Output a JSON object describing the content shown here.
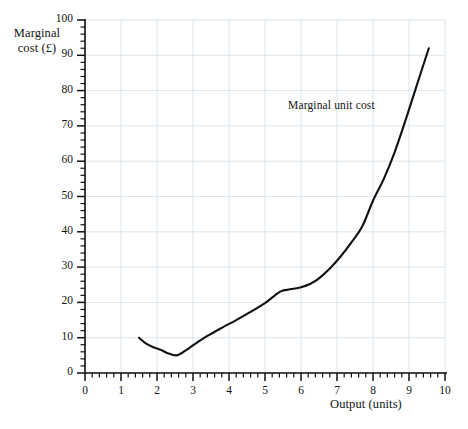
{
  "chart_data": {
    "type": "line",
    "title": "",
    "xlabel": "Output (units)",
    "ylabel": "Marginal cost (£)",
    "xlim": [
      0,
      10
    ],
    "ylim": [
      0,
      100
    ],
    "grid": true,
    "legend_position": "inline-annotation",
    "annotations": [
      {
        "text": "Marginal unit cost",
        "x": 7.0,
        "y": 73
      }
    ],
    "xticks": [
      0,
      1,
      2,
      3,
      4,
      5,
      6,
      7,
      8,
      9,
      10
    ],
    "xtick_labels": [
      "0",
      "1",
      "2",
      "3",
      "4",
      "5",
      "6",
      "7",
      "8",
      "9",
      "10"
    ],
    "xminor_tick_step": 0.2,
    "yticks": [
      0,
      10,
      20,
      30,
      40,
      50,
      60,
      70,
      80,
      90,
      100
    ],
    "ytick_labels": [
      "0",
      "10",
      "20",
      "30",
      "40",
      "50",
      "60",
      "70",
      "80",
      "90",
      "100"
    ],
    "yminor_tick_step": 2,
    "series": [
      {
        "name": "Marginal unit cost",
        "color": "#111111",
        "x": [
          1.5,
          1.7,
          1.9,
          2.1,
          2.3,
          2.55,
          2.8,
          3.05,
          3.4,
          3.8,
          4.2,
          4.6,
          5.0,
          5.25,
          5.45,
          5.7,
          6.0,
          6.25,
          6.5,
          6.8,
          7.1,
          7.4,
          7.7,
          8.0,
          8.3,
          8.6,
          8.9,
          9.2,
          9.55
        ],
        "y": [
          10.0,
          8.3,
          7.3,
          6.6,
          5.6,
          5.0,
          6.4,
          8.2,
          10.5,
          12.8,
          15.0,
          17.3,
          19.8,
          21.8,
          23.2,
          23.7,
          24.3,
          25.2,
          26.8,
          29.6,
          33.0,
          37.0,
          41.5,
          48.8,
          55.0,
          62.5,
          71.5,
          81.0,
          92.0
        ]
      }
    ]
  },
  "axes": {
    "y_title_text": "Marginal\ncost (£)",
    "x_title_text": "Output (units)"
  },
  "style": {
    "axis_color": "#111111",
    "grid_color": "#c6d4e2",
    "line_color": "#111111",
    "background": "#ffffff"
  }
}
